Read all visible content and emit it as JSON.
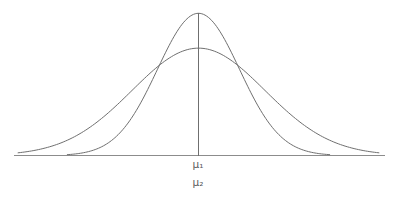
{
  "figure": {
    "title": "",
    "background_color": "#ffffff",
    "line_color": "#6f6f6f",
    "axis_color": "#8c8c8c",
    "label_color": "#5c5c5c",
    "mean_label_1": "μ₁",
    "mean_label_2": "μ₂",
    "mean_line_label": "mean-vertical-line"
  },
  "chart_data": {
    "type": "line",
    "title": "",
    "subtitle": "",
    "xlabel": "",
    "ylabel": "",
    "grid": false,
    "legend": false,
    "legend_position": "none",
    "annotations": [
      {
        "text": "μ₁",
        "x": 0,
        "y": 0,
        "note": "mean of curve 1, on x-axis below vertical line"
      },
      {
        "text": "μ₂",
        "x": 0,
        "y": 0,
        "note": "mean of curve 2, equal to mean of curve 1"
      }
    ],
    "tick_labels": {
      "x": [
        "μ₁",
        "μ₂"
      ],
      "y": []
    },
    "xlim": [
      -4.6,
      4.6
    ],
    "ylim": [
      0,
      1.05
    ],
    "series": [
      {
        "name": "narrow-tall-normal-curve",
        "distribution": "normal",
        "mean": 0,
        "std": 1.0,
        "peak_height": 1.0,
        "color": "#6f6f6f",
        "x": [
          -3.2,
          -2.8,
          -2.4,
          -2.0,
          -1.6,
          -1.2,
          -0.8,
          -0.4,
          0.0,
          0.4,
          0.8,
          1.2,
          1.6,
          2.0,
          2.4,
          2.8,
          3.2
        ],
        "values": [
          0.006,
          0.019,
          0.056,
          0.135,
          0.278,
          0.487,
          0.726,
          0.923,
          1.0,
          0.923,
          0.726,
          0.487,
          0.278,
          0.135,
          0.056,
          0.019,
          0.006
        ]
      },
      {
        "name": "wide-short-normal-curve",
        "distribution": "normal",
        "mean": 0,
        "std": 1.62,
        "peak_height": 0.755,
        "color": "#6f6f6f",
        "x": [
          -4.4,
          -3.9,
          -3.4,
          -2.9,
          -2.4,
          -1.9,
          -1.4,
          -0.9,
          -0.4,
          0.0,
          0.4,
          0.9,
          1.4,
          1.9,
          2.4,
          2.9,
          3.4,
          3.9,
          4.4
        ],
        "values": [
          0.018,
          0.042,
          0.089,
          0.168,
          0.282,
          0.424,
          0.572,
          0.7,
          0.773,
          0.755,
          0.773,
          0.7,
          0.572,
          0.424,
          0.282,
          0.168,
          0.089,
          0.042,
          0.018
        ]
      }
    ],
    "intersections": [
      {
        "x": -1.38,
        "y": 0.395,
        "note": "left crossing point of the two curves"
      },
      {
        "x": 1.38,
        "y": 0.395,
        "note": "right crossing point of the two curves"
      }
    ]
  }
}
